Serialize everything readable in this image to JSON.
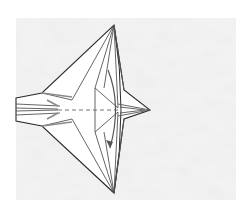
{
  "diagram": {
    "type": "origami-step",
    "colors": {
      "background_texture": "#e4e4e4",
      "background_texture_light": "#f2f2f2",
      "paper": "#ffffff",
      "line": "#2a2a2a",
      "inner_line": "#555555",
      "gray_line": "#8a8a8a",
      "dash": "#666666",
      "arrow": "#555555"
    },
    "texture_rect": {
      "x": 16,
      "y": 18,
      "w": 220,
      "h": 182
    },
    "outline": [
      [
        16,
        98
      ],
      [
        42,
        93
      ],
      [
        114,
        25
      ],
      [
        124,
        90
      ],
      [
        150,
        110
      ],
      [
        124,
        119
      ],
      [
        114,
        193
      ],
      [
        42,
        126
      ],
      [
        16,
        121
      ]
    ],
    "lines": [
      [
        [
          114,
          25
        ],
        [
          72,
          100
        ]
      ],
      [
        [
          114,
          25
        ],
        [
          95,
          88
        ]
      ],
      [
        [
          114,
          25
        ],
        [
          104,
          88
        ]
      ],
      [
        [
          114,
          25
        ],
        [
          118,
          108
        ]
      ],
      [
        [
          114,
          25
        ],
        [
          124,
          90
        ]
      ],
      [
        [
          114,
          193
        ],
        [
          72,
          119
        ]
      ],
      [
        [
          114,
          193
        ],
        [
          95,
          132
        ]
      ],
      [
        [
          114,
          193
        ],
        [
          104,
          132
        ]
      ],
      [
        [
          114,
          193
        ],
        [
          118,
          112
        ]
      ],
      [
        [
          114,
          193
        ],
        [
          124,
          119
        ]
      ],
      [
        [
          42,
          93
        ],
        [
          72,
          100
        ]
      ],
      [
        [
          42,
          126
        ],
        [
          72,
          119
        ]
      ],
      [
        [
          95,
          88
        ],
        [
          95,
          132
        ]
      ],
      [
        [
          95,
          88
        ],
        [
          118,
          108
        ]
      ],
      [
        [
          95,
          132
        ],
        [
          118,
          112
        ]
      ],
      [
        [
          16,
          104
        ],
        [
          60,
          106
        ]
      ],
      [
        [
          16,
          115
        ],
        [
          60,
          113
        ]
      ],
      [
        [
          16,
          108
        ],
        [
          58,
          109
        ]
      ],
      [
        [
          16,
          111
        ],
        [
          58,
          110
        ]
      ],
      [
        [
          118,
          104
        ],
        [
          150,
          110
        ]
      ],
      [
        [
          118,
          116
        ],
        [
          150,
          110
        ]
      ],
      [
        [
          120,
          107
        ],
        [
          145,
          110
        ]
      ],
      [
        [
          120,
          113
        ],
        [
          145,
          110
        ]
      ]
    ],
    "gray_lines": [
      [
        [
          42,
          93
        ],
        [
          72,
          97
        ]
      ],
      [
        [
          42,
          126
        ],
        [
          72,
          122
        ]
      ],
      [
        [
          47,
          100
        ],
        [
          58,
          106
        ]
      ],
      [
        [
          47,
          119
        ],
        [
          58,
          113
        ]
      ]
    ],
    "valley_fold_line": {
      "x1": 58,
      "y1": 110,
      "x2": 120,
      "y2": 110
    },
    "curved_fold_edge": {
      "d": "M114,25 Q128,110 114,193"
    },
    "fold_arrow": {
      "d": "M108,70 Q122,105 110,148",
      "head": [
        [
          110,
          148
        ],
        [
          106,
          140
        ],
        [
          113,
          142
        ]
      ]
    }
  }
}
